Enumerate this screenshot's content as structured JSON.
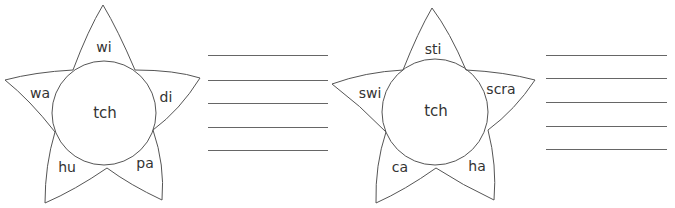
{
  "worksheets": [
    {
      "center": "tch",
      "petals": [
        "wi",
        "di",
        "pa",
        "hu",
        "wa"
      ],
      "answer_lines": 5
    },
    {
      "center": "tch",
      "petals": [
        "sti",
        "scra",
        "ha",
        "ca",
        "swi"
      ],
      "answer_lines": 5
    }
  ],
  "colors": {
    "stroke": "#555555",
    "text": "#333333"
  }
}
